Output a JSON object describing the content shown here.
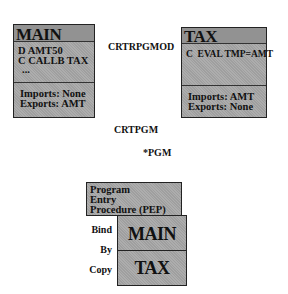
{
  "modules": {
    "main": {
      "title": "MAIN",
      "code_lines": [
        "D AMT50",
        "C CALLB TAX",
        "..."
      ],
      "imports": "Imports: None",
      "exports": "Exports: AMT"
    },
    "tax": {
      "title": "TAX",
      "code_lines": [
        "C  EVAL TMP=AMT"
      ],
      "imports": "Imports: AMT",
      "exports": "Exports: None"
    }
  },
  "arrows": {
    "crtrpgmod": "CRTRPGMOD",
    "crtpgm": "CRTPGM"
  },
  "program": {
    "label": "*PGM",
    "pep_lines": [
      "Program",
      "Entry",
      "Procedure (PEP)"
    ],
    "bound_modules": [
      "MAIN",
      "TAX"
    ],
    "bind_labels": [
      "Bind",
      "By",
      "Copy"
    ]
  },
  "colors": {
    "face": "#a9a9a9",
    "top": "#8c8c8c",
    "side": "#7b7b7b",
    "line": "#000000"
  }
}
